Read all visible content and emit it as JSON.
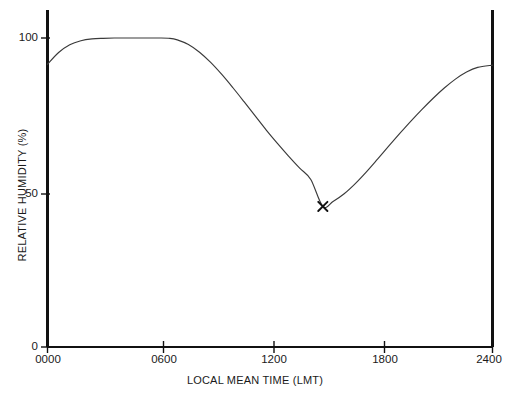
{
  "chart_data": {
    "type": "line",
    "title": "",
    "subtitle": "",
    "xlabel": "LOCAL MEAN TIME (LMT)",
    "ylabel": "RELATIVE HUMIDITY (%)",
    "xlim": [
      0,
      2400
    ],
    "ylim": [
      0,
      100
    ],
    "grid": false,
    "legend": "none",
    "xticks": [
      {
        "value": 0,
        "label": "0000"
      },
      {
        "value": 600,
        "label": "0600"
      },
      {
        "value": 1200,
        "label": "1200"
      },
      {
        "value": 1800,
        "label": "1800"
      },
      {
        "value": 2400,
        "label": "2400"
      }
    ],
    "yticks": [
      {
        "value": 0,
        "label": "0"
      },
      {
        "value": 50,
        "label": "50"
      },
      {
        "value": 100,
        "label": "100"
      }
    ],
    "series": [
      {
        "name": "Relative humidity",
        "color": "#3a3a3a",
        "x": [
          0,
          60,
          120,
          180,
          240,
          300,
          360,
          420,
          480,
          540,
          600,
          660,
          700,
          760,
          820,
          880,
          940,
          1000,
          1060,
          1120,
          1180,
          1240,
          1300,
          1360,
          1420,
          1485,
          1540,
          1600,
          1660,
          1720,
          1780,
          1840,
          1900,
          1960,
          2020,
          2080,
          2140,
          2200,
          2260,
          2320,
          2400
        ],
        "y": [
          91.5,
          95.3,
          97.8,
          99.1,
          99.7,
          99.9,
          100.0,
          100.0,
          100.0,
          100.0,
          100.0,
          99.9,
          99.4,
          97.9,
          95.4,
          92.1,
          88.2,
          83.9,
          79.4,
          74.8,
          70.2,
          65.9,
          61.8,
          57.9,
          54.2,
          45.5,
          47.1,
          49.6,
          52.9,
          56.7,
          60.8,
          65.0,
          69.1,
          73.1,
          76.9,
          80.5,
          83.8,
          86.7,
          89.0,
          90.5,
          91.2
        ]
      }
    ],
    "annotations": [
      {
        "name": "minimum-marker",
        "marker": "x",
        "x": 1485,
        "y": 45.5,
        "label": ""
      }
    ]
  }
}
